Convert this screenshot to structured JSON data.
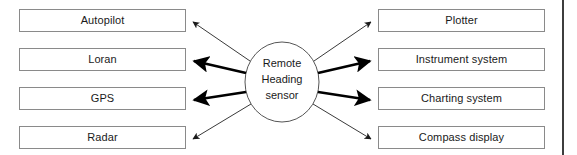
{
  "diagram": {
    "hub": {
      "name": "remote-heading-sensor",
      "lines": [
        "Remote",
        "Heading",
        "sensor"
      ],
      "shape": "ellipse",
      "cx": 282,
      "cy": 82,
      "rx": 37,
      "ry": 40,
      "stroke": "#555555",
      "fill": "#ffffff"
    },
    "left_nodes": [
      {
        "label": "Autopilot",
        "name": "node-autopilot"
      },
      {
        "label": "Loran",
        "name": "node-loran"
      },
      {
        "label": "GPS",
        "name": "node-gps"
      },
      {
        "label": "Radar",
        "name": "node-radar"
      }
    ],
    "right_nodes": [
      {
        "label": "Plotter",
        "name": "node-plotter"
      },
      {
        "label": "Instrument system",
        "name": "node-instrument-system"
      },
      {
        "label": "Charting system",
        "name": "node-charting-system"
      },
      {
        "label": "Compass display",
        "name": "node-compass-display"
      }
    ],
    "arrows": [
      {
        "name": "arrow-to-autopilot",
        "target": "Autopilot",
        "weight": "thin",
        "x1": 250,
        "y1": 61,
        "x2": 193,
        "y2": 22
      },
      {
        "name": "arrow-to-loran",
        "target": "Loran",
        "weight": "thick",
        "x1": 246,
        "y1": 73,
        "x2": 193,
        "y2": 61
      },
      {
        "name": "arrow-to-gps",
        "target": "GPS",
        "weight": "thick",
        "x1": 246,
        "y1": 92,
        "x2": 193,
        "y2": 100
      },
      {
        "name": "arrow-to-radar",
        "target": "Radar",
        "weight": "thin",
        "x1": 251,
        "y1": 104,
        "x2": 193,
        "y2": 139
      },
      {
        "name": "arrow-to-plotter",
        "target": "Plotter",
        "weight": "thin",
        "x1": 314,
        "y1": 61,
        "x2": 371,
        "y2": 22
      },
      {
        "name": "arrow-to-instrument-system",
        "target": "Instrument system",
        "weight": "thick",
        "x1": 318,
        "y1": 73,
        "x2": 371,
        "y2": 61
      },
      {
        "name": "arrow-to-charting-system",
        "target": "Charting system",
        "weight": "thick",
        "x1": 318,
        "y1": 92,
        "x2": 371,
        "y2": 100
      },
      {
        "name": "arrow-to-compass-display",
        "target": "Compass display",
        "weight": "thin",
        "x1": 313,
        "y1": 104,
        "x2": 371,
        "y2": 139
      }
    ],
    "colors": {
      "box_border": "#8a8a8a",
      "text": "#1a1a1a",
      "arrow_thin": "#3a3a3a",
      "arrow_thick": "#000000",
      "rule": "#3d3d3d",
      "background": "#ffffff"
    },
    "right_rule": {
      "name": "page-edge-rule",
      "x": 562,
      "width": 2
    }
  }
}
